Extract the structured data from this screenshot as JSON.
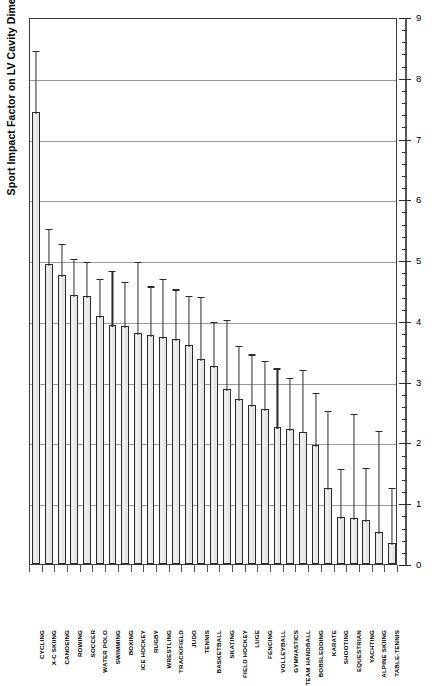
{
  "chart_data": {
    "type": "bar",
    "title": "",
    "xlabel": "",
    "ylabel": "Sport Impact Factor on LV Cavity Dimension (mm)",
    "ylim": [
      0,
      9
    ],
    "ytick_labels": [
      "0",
      "1",
      "2",
      "3",
      "4",
      "5",
      "6",
      "7",
      "8",
      "9"
    ],
    "ytick_values": [
      0,
      1,
      2,
      3,
      4,
      5,
      6,
      7,
      8,
      9
    ],
    "minor_ticks_per_interval": 5,
    "grid": true,
    "grid_axis": "y",
    "legend": "none",
    "errorbars": "upper-only",
    "categories": [
      "CYCLING",
      "X-C SKIING",
      "CANOEING",
      "ROWING",
      "SOCCER",
      "WATER POLO",
      "SWIMMING",
      "BOXING",
      "ICE HOCKEY",
      "RUGBY",
      "WRESTLING",
      "TRACK/FIELD",
      "JUDO",
      "TENNIS",
      "BASKETBALL",
      "SKATING",
      "FIELD HOCKEY",
      "LUGE",
      "FENCING",
      "VOLLEYBALL",
      "GYMNASTICS",
      "TEAM HANDBALL",
      "BOBSLEDDING",
      "KARATE",
      "SHOOTING",
      "EQUESTRIAN",
      "YACHTING",
      "ALPINE SKIING",
      "TABLE-TENNIS"
    ],
    "values": [
      7.43,
      4.93,
      4.75,
      4.42,
      4.41,
      4.08,
      3.93,
      3.92,
      3.8,
      3.77,
      3.73,
      3.7,
      3.6,
      3.38,
      3.25,
      2.88,
      2.72,
      2.62,
      2.55,
      2.25,
      2.22,
      2.18,
      1.95,
      1.25,
      0.78,
      0.75,
      0.72,
      0.52,
      0.35
    ],
    "upper_error": [
      8.47,
      5.55,
      5.3,
      5.05,
      5.0,
      4.73,
      4.85,
      4.68,
      5.0,
      4.6,
      4.72,
      4.55,
      4.45,
      4.42,
      4.02,
      4.05,
      3.62,
      3.48,
      3.38,
      3.25,
      3.1,
      3.22,
      2.85,
      2.55,
      1.6,
      2.5,
      1.62,
      2.22,
      1.28
    ],
    "colors": {
      "bar_fill": "#ececec",
      "bar_edge": "#2b2b2b",
      "grid": "#9a9a9a",
      "axis": "#3a3a3a",
      "errorbar": "#2b2b2b"
    }
  }
}
